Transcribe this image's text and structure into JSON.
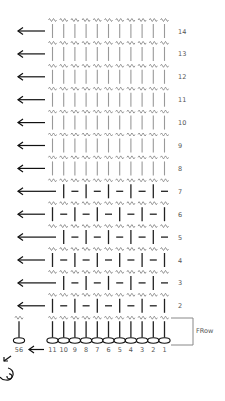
{
  "diagram": {
    "type": "crochet-stitch-chart",
    "columns": 11,
    "rows": [
      {
        "number": "14",
        "pattern": "bars-light"
      },
      {
        "number": "13",
        "pattern": "bars-light"
      },
      {
        "number": "12",
        "pattern": "bars-light"
      },
      {
        "number": "11",
        "pattern": "bars-light"
      },
      {
        "number": "10",
        "pattern": "bars-light"
      },
      {
        "number": "9",
        "pattern": "bars-light"
      },
      {
        "number": "8",
        "pattern": "bars-light"
      },
      {
        "number": "7",
        "pattern": "dash-bar-alternating"
      },
      {
        "number": "6",
        "pattern": "bar-dash-alternating"
      },
      {
        "number": "5",
        "pattern": "dash-bar-alternating"
      },
      {
        "number": "4",
        "pattern": "bar-dash-alternating"
      },
      {
        "number": "3",
        "pattern": "dash-bar-alternating"
      },
      {
        "number": "2",
        "pattern": "bar-dash-alternating"
      }
    ],
    "foundation": {
      "label": "FRow",
      "chain_numbers": [
        "11",
        "10",
        "9",
        "8",
        "7",
        "6",
        "5",
        "4",
        "3",
        "2",
        "1"
      ],
      "turning_chain_number": "56"
    },
    "colors": {
      "light_stitch": "#999999",
      "dark_stitch": "#222222",
      "wave": "#888888",
      "arrow": "#111111",
      "label": "#555555"
    }
  }
}
